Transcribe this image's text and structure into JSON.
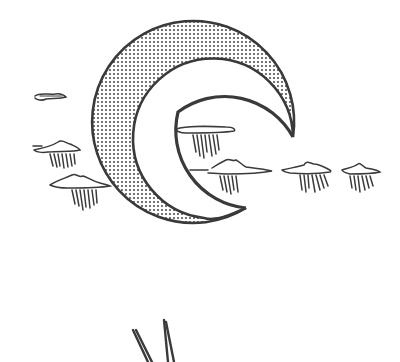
{
  "illustration": {
    "title": "Crescent moon with rain clouds",
    "subject": "crescent-moon",
    "stroke_color": "#3a3a3a",
    "background_color": "#ffffff",
    "elements": [
      {
        "type": "crescent-moon",
        "fill": "stippled"
      },
      {
        "type": "cloud",
        "rain": false,
        "position": "far-left-top"
      },
      {
        "type": "cloud",
        "rain": true,
        "position": "left-middle"
      },
      {
        "type": "cloud",
        "rain": true,
        "position": "left-lower"
      },
      {
        "type": "cloud",
        "rain": true,
        "position": "inside-crescent-upper"
      },
      {
        "type": "cloud",
        "rain": true,
        "position": "inside-crescent-lower"
      },
      {
        "type": "cloud",
        "rain": true,
        "position": "right-1"
      },
      {
        "type": "cloud",
        "rain": true,
        "position": "right-2"
      },
      {
        "type": "partial-figure",
        "position": "bottom-cropped"
      }
    ]
  }
}
